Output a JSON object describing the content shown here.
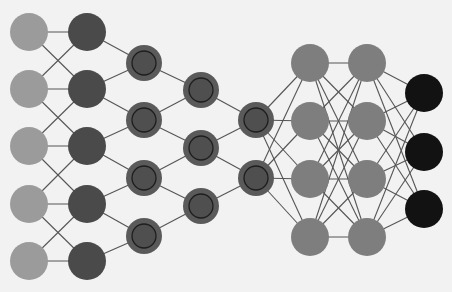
{
  "diagram": {
    "background": "#f2f2f2",
    "edge_color": "#555555",
    "node_radius": 19,
    "layers": [
      {
        "id": "input",
        "kind": "input",
        "fill": "#9b9b9b",
        "nodes": [
          {
            "x": 29,
            "y": 32
          },
          {
            "x": 29,
            "y": 89
          },
          {
            "x": 29,
            "y": 146
          },
          {
            "x": 29,
            "y": 204
          },
          {
            "x": 29,
            "y": 261
          }
        ]
      },
      {
        "id": "hidden1",
        "kind": "hidden",
        "fill": "#4a4a4a",
        "nodes": [
          {
            "x": 87,
            "y": 32
          },
          {
            "x": 87,
            "y": 89
          },
          {
            "x": 87,
            "y": 146
          },
          {
            "x": 87,
            "y": 204
          },
          {
            "x": 87,
            "y": 261
          }
        ]
      },
      {
        "id": "conv1",
        "kind": "convolution",
        "fill": "#5a5a5a",
        "inner_fill": "#4f4f4f",
        "ring": "#1e1e1e",
        "nodes": [
          {
            "x": 144,
            "y": 63
          },
          {
            "x": 144,
            "y": 120
          },
          {
            "x": 144,
            "y": 178
          },
          {
            "x": 144,
            "y": 236
          }
        ]
      },
      {
        "id": "conv2",
        "kind": "convolution",
        "fill": "#5a5a5a",
        "inner_fill": "#4f4f4f",
        "ring": "#1e1e1e",
        "nodes": [
          {
            "x": 201,
            "y": 90
          },
          {
            "x": 201,
            "y": 148
          },
          {
            "x": 201,
            "y": 206
          }
        ]
      },
      {
        "id": "conv3",
        "kind": "convolution",
        "fill": "#5a5a5a",
        "inner_fill": "#4f4f4f",
        "ring": "#1e1e1e",
        "nodes": [
          {
            "x": 256,
            "y": 120
          },
          {
            "x": 256,
            "y": 178
          }
        ]
      },
      {
        "id": "fc1",
        "kind": "fully-connected",
        "fill": "#7e7e7e",
        "nodes": [
          {
            "x": 310,
            "y": 63
          },
          {
            "x": 310,
            "y": 121
          },
          {
            "x": 310,
            "y": 179
          },
          {
            "x": 310,
            "y": 237
          }
        ]
      },
      {
        "id": "fc2",
        "kind": "fully-connected",
        "fill": "#7e7e7e",
        "nodes": [
          {
            "x": 367,
            "y": 63
          },
          {
            "x": 367,
            "y": 121
          },
          {
            "x": 367,
            "y": 179
          },
          {
            "x": 367,
            "y": 237
          }
        ]
      },
      {
        "id": "output",
        "kind": "output",
        "fill": "#121212",
        "nodes": [
          {
            "x": 424,
            "y": 93
          },
          {
            "x": 424,
            "y": 152
          },
          {
            "x": 424,
            "y": 209
          }
        ]
      }
    ],
    "connections": [
      {
        "from": "input",
        "to": "hidden1",
        "pattern": "neighbor-1"
      },
      {
        "from": "hidden1",
        "to": "conv1",
        "pattern": "window-2"
      },
      {
        "from": "conv1",
        "to": "conv2",
        "pattern": "window-2"
      },
      {
        "from": "conv2",
        "to": "conv3",
        "pattern": "window-2"
      },
      {
        "from": "conv3",
        "to": "fc1",
        "pattern": "full"
      },
      {
        "from": "fc1",
        "to": "fc2",
        "pattern": "full"
      },
      {
        "from": "fc2",
        "to": "output",
        "pattern": "full"
      }
    ]
  }
}
